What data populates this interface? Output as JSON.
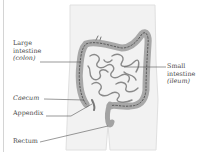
{
  "figure": {
    "type": "anatomical-diagram",
    "colors": {
      "body_fill": "#f1f1f1",
      "body_outline": "#dcdcdc",
      "colon_fill": "#a9a9a9",
      "colon_stroke": "#5a5a5a",
      "small_intestine": "#8c8c8c",
      "leader_line": "#555555",
      "label_text": "#4a4a4a"
    }
  },
  "labels": {
    "large_intestine": {
      "line1": "Large",
      "line2": "intestine",
      "line3": "(colon)"
    },
    "small_intestine": {
      "line1": "Small",
      "line2": "intestine",
      "line3": "(ileum)"
    },
    "caecum": "Caecum",
    "appendix": "Appendix",
    "rectum": "Rectum"
  }
}
